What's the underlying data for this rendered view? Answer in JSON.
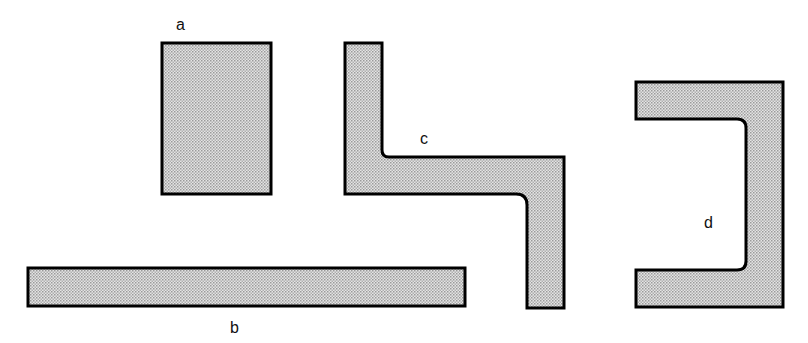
{
  "diagram": {
    "fill_color": "#d8d8d8",
    "stroke_color": "#000000",
    "shapes": [
      {
        "id": "a",
        "label": "a",
        "kind": "rectangle"
      },
      {
        "id": "b",
        "label": "b",
        "kind": "long-bar"
      },
      {
        "id": "c",
        "label": "c",
        "kind": "z-shape"
      },
      {
        "id": "d",
        "label": "d",
        "kind": "c-bracket"
      }
    ]
  }
}
